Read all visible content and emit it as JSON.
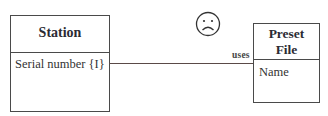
{
  "diagram": {
    "classes": [
      {
        "name": "Station",
        "attributes": [
          "Serial number  {I}"
        ]
      },
      {
        "name_line1": "Preset",
        "name_line2": "File",
        "attributes": [
          "Name"
        ]
      }
    ],
    "association": {
      "label": "uses"
    },
    "annotation_icon": "sad-face-icon"
  }
}
